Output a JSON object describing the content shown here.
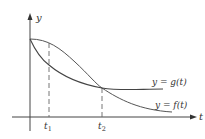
{
  "figure": {
    "axes": {
      "x_label": "t",
      "y_label": "y"
    },
    "curves": [
      {
        "name": "g",
        "label": "y = g(t)"
      },
      {
        "name": "f",
        "label": "y = f(t)"
      }
    ],
    "ticks": [
      {
        "base": "t",
        "sub": "1"
      },
      {
        "base": "t",
        "sub": "2"
      }
    ],
    "colors": {
      "axis": "#444444",
      "curve": "#555555",
      "dash": "#666666"
    }
  }
}
